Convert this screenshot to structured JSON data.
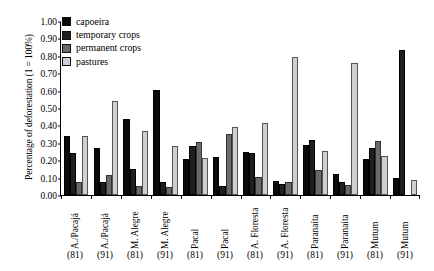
{
  "chart_data": {
    "type": "bar",
    "title": "",
    "xlabel": "",
    "ylabel": "Percentage of deforestation (1 = 100%)",
    "ylim": [
      0,
      1.0
    ],
    "ytick_labels": [
      "1.00",
      "0.90",
      "0.80",
      "0.70",
      "0.60",
      "0.50",
      "0.40",
      "0.30",
      "0.20",
      "0.10",
      "0.00"
    ],
    "ytick_values": [
      1.0,
      0.9,
      0.8,
      0.7,
      0.6,
      0.5,
      0.4,
      0.3,
      0.2,
      0.1,
      0.0
    ],
    "grid": false,
    "legend_position": "upper-left-inside",
    "categories": [
      "A./Pacajá",
      "A./Pacajá",
      "M. Alegre",
      "M. Alegre",
      "Pacal",
      "Pacal",
      "A. Floresta",
      "A. Floresta",
      "Paranaíta",
      "Paranaíta",
      "Mutum",
      "Mutum"
    ],
    "year_labels": [
      "(81)",
      "(91)",
      "(81)",
      "(91)",
      "(81)",
      "(91)",
      "(81)",
      "(91)",
      "(81)",
      "(91)",
      "(81)",
      "(91)"
    ],
    "series": [
      {
        "name": "capoeira",
        "color": "#0a0a0a",
        "values": [
          0.34,
          0.27,
          0.435,
          0.605,
          0.205,
          0.22,
          0.245,
          0.08,
          0.29,
          0.12,
          0.205,
          0.095
        ]
      },
      {
        "name": "temporary crops",
        "color": "#1f1f1f",
        "values": [
          0.24,
          0.075,
          0.15,
          0.075,
          0.28,
          0.05,
          0.24,
          0.065,
          0.315,
          0.075,
          0.27,
          0.835
        ]
      },
      {
        "name": "permanent crops",
        "color": "#6a6a6a",
        "values": [
          0.075,
          0.115,
          0.05,
          0.045,
          0.305,
          0.35,
          0.105,
          0.075,
          0.145,
          0.055,
          0.31,
          0.0
        ]
      },
      {
        "name": "pastures",
        "color": "#cfcfcf",
        "values": [
          0.34,
          0.54,
          0.37,
          0.28,
          0.215,
          0.39,
          0.415,
          0.795,
          0.255,
          0.76,
          0.225,
          0.085
        ]
      }
    ]
  }
}
